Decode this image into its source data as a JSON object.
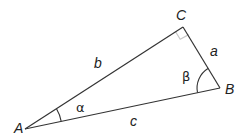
{
  "diagram": {
    "type": "right-triangle",
    "vertices": {
      "A": {
        "label": "A",
        "x": 25,
        "y": 129
      },
      "B": {
        "label": "B",
        "x": 220,
        "y": 88
      },
      "C": {
        "label": "C",
        "x": 183,
        "y": 27
      }
    },
    "sides": {
      "a": {
        "label": "a",
        "between": [
          "B",
          "C"
        ]
      },
      "b": {
        "label": "b",
        "between": [
          "A",
          "C"
        ]
      },
      "c": {
        "label": "c",
        "between": [
          "A",
          "B"
        ]
      }
    },
    "angles": {
      "alpha": {
        "label": "α",
        "at": "A"
      },
      "beta": {
        "label": "β",
        "at": "B"
      }
    },
    "right_angle_at": "C",
    "colors": {
      "line": "#333333",
      "right_angle_mark": "#c8c8c8",
      "text": "#222222"
    }
  }
}
